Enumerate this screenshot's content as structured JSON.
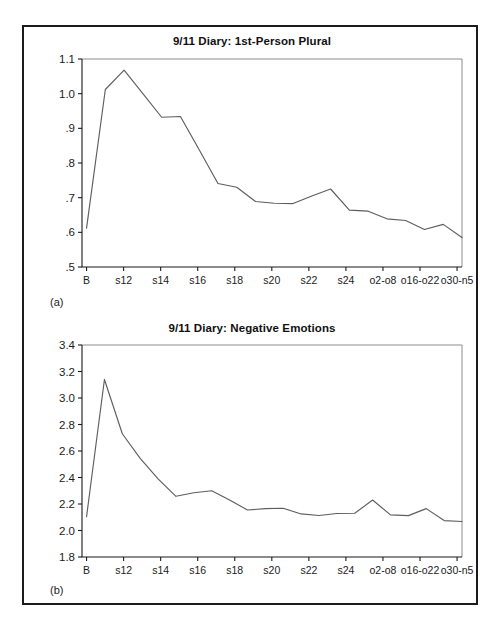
{
  "figure": {
    "panel_a_label": "(a)",
    "panel_b_label": "(b)"
  },
  "chart_data": [
    {
      "type": "line",
      "title": "9/11 Diary: 1st-Person Plural",
      "panel": "(a)",
      "xlabel": "",
      "ylabel": "",
      "ylim": [
        0.5,
        1.1
      ],
      "ytick_labels": [
        "1.1",
        "1.0",
        ".9",
        ".8",
        ".7",
        ".6",
        ".5"
      ],
      "ytick_values": [
        1.1,
        1.0,
        0.9,
        0.8,
        0.7,
        0.6,
        0.5
      ],
      "xtick_labels": [
        "B",
        "s12",
        "s14",
        "s16",
        "s18",
        "s20",
        "s22",
        "s24",
        "o2-o8",
        "o16-o22",
        "o30-n5"
      ],
      "grid": false,
      "legend": "none",
      "line_color": "#5e5e5e",
      "categories": [
        "B",
        "s11",
        "s12",
        "s13",
        "s14",
        "s15",
        "s16",
        "s17",
        "s18",
        "s19",
        "s20",
        "s21",
        "s22",
        "s23",
        "s24",
        "o2-o8",
        "o9-o15",
        "o16-o22",
        "o23-o29",
        "o30-n5",
        "end"
      ],
      "values": [
        0.612,
        1.012,
        1.068,
        1.0,
        0.932,
        0.934,
        0.838,
        0.741,
        0.73,
        0.689,
        0.684,
        0.683,
        0.705,
        0.725,
        0.664,
        0.661,
        0.639,
        0.634,
        0.608,
        0.623,
        0.585
      ]
    },
    {
      "type": "line",
      "title": "9/11 Diary: Negative Emotions",
      "panel": "(b)",
      "xlabel": "",
      "ylabel": "",
      "ylim": [
        1.8,
        3.4
      ],
      "ytick_labels": [
        "3.4",
        "3.2",
        "3.0",
        "2.8",
        "2.6",
        "2.4",
        "2.2",
        "2.0",
        "1.8"
      ],
      "ytick_values": [
        3.4,
        3.2,
        3.0,
        2.8,
        2.6,
        2.4,
        2.2,
        2.0,
        1.8
      ],
      "xtick_labels": [
        "B",
        "s12",
        "s14",
        "s16",
        "s18",
        "s20",
        "s22",
        "s24",
        "o2-o8",
        "o16-o22",
        "o30-n5"
      ],
      "grid": false,
      "legend": "none",
      "line_color": "#5e5e5e",
      "categories": [
        "B",
        "s11",
        "s12",
        "s13",
        "s14",
        "s15",
        "s16",
        "s17",
        "s18",
        "s19",
        "s20",
        "s21",
        "s22",
        "s23",
        "s24",
        "o2-o8",
        "o9-o15",
        "o16-o22",
        "o23-o29",
        "o30-n5",
        "end"
      ],
      "values": [
        2.105,
        3.14,
        2.73,
        2.545,
        2.39,
        2.258,
        2.285,
        2.3,
        2.23,
        2.155,
        2.165,
        2.168,
        2.125,
        2.113,
        2.128,
        2.13,
        2.23,
        2.118,
        2.112,
        2.165,
        2.075,
        2.068
      ]
    }
  ]
}
